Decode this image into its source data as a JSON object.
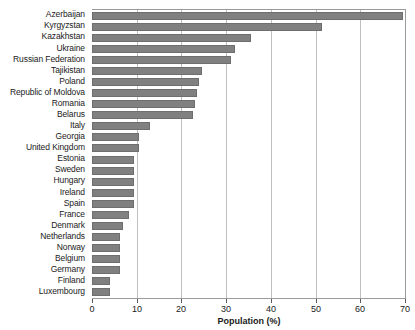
{
  "chart_data": {
    "type": "bar",
    "orientation": "horizontal",
    "title": "",
    "xlabel": "Population (%)",
    "ylabel": "",
    "xlim": [
      0,
      70
    ],
    "ylim": null,
    "xticks": [
      0,
      10,
      20,
      30,
      40,
      50,
      60,
      70
    ],
    "xtick_labels": [
      "0",
      "10",
      "20",
      "30",
      "40",
      "50",
      "60",
      "70"
    ],
    "grid": "vertical",
    "legend": null,
    "bar_color": "#808080",
    "bar_edge_color": "#6e6e6e",
    "plot_background": "#ffffff",
    "gridline_color": "#bfbfbf",
    "axis_color": "#9a9a9a",
    "categories": [
      "Azerbaijan",
      "Kyrgyzstan",
      "Kazakhstan",
      "Ukraine",
      "Russian Federation",
      "Tajikistan",
      "Poland",
      "Republic of Moldova",
      "Romania",
      "Belarus",
      "Italy",
      "Georgia",
      "United Kingdom",
      "Estonia",
      "Sweden",
      "Hungary",
      "Ireland",
      "Spain",
      "France",
      "Denmark",
      "Netherlands",
      "Norway",
      "Belgium",
      "Germany",
      "Finland",
      "Luxembourg"
    ],
    "values": [
      69.5,
      51.5,
      35.5,
      32.0,
      31.0,
      24.5,
      24.0,
      23.5,
      23.0,
      22.5,
      13.0,
      10.5,
      10.5,
      9.5,
      9.3,
      9.3,
      9.3,
      9.3,
      8.2,
      7.0,
      6.2,
      6.2,
      6.2,
      6.2,
      4.0,
      4.0
    ]
  }
}
